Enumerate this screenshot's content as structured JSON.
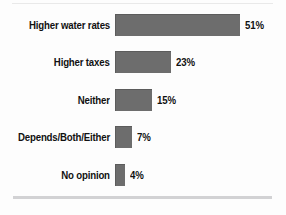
{
  "chart_data": {
    "type": "bar",
    "orientation": "horizontal",
    "title": "",
    "subtitle": "",
    "xlabel": "",
    "ylabel": "",
    "grid": false,
    "legend": false,
    "legend_position": "none",
    "axis_visible": false,
    "xlim": [
      0,
      51
    ],
    "bar_color": "#6d6d6d",
    "bar_edge_color": "#5c5c5c",
    "text_color": "#111111",
    "background_color": "#fdfdfd",
    "rule_color": "#d2d2d4",
    "value_suffix": "%",
    "categories": [
      "Higher water rates",
      "Higher taxes",
      "Neither",
      "Depends/Both/Either",
      "No opinion"
    ],
    "values": [
      51,
      23,
      15,
      7,
      4
    ],
    "value_labels": [
      "51%",
      "23%",
      "15%",
      "7%",
      "4%"
    ],
    "bars": [
      {
        "category": "Higher water rates",
        "value": 51,
        "value_label": "51%"
      },
      {
        "category": "Higher taxes",
        "value": 23,
        "value_label": "23%"
      },
      {
        "category": "Neither",
        "value": 15,
        "value_label": "15%"
      },
      {
        "category": "Depends/Both/Either",
        "value": 7,
        "value_label": "7%"
      },
      {
        "category": "No opinion",
        "value": 4,
        "value_label": "4%"
      }
    ]
  }
}
